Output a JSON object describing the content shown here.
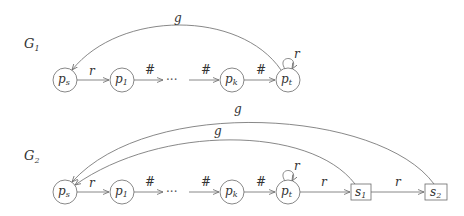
{
  "graphs": [
    {
      "name": "G",
      "index": "1",
      "nodes": [
        {
          "id": "ps",
          "base": "p",
          "sub": "s",
          "shape": "circle"
        },
        {
          "id": "p1",
          "base": "p",
          "sub": "1",
          "shape": "circle"
        },
        {
          "id": "dots",
          "base": "···",
          "sub": "",
          "shape": "none"
        },
        {
          "id": "pk",
          "base": "p",
          "sub": "k",
          "shape": "circle"
        },
        {
          "id": "pt",
          "base": "p",
          "sub": "t",
          "shape": "circle"
        }
      ],
      "edges": [
        {
          "from": "ps",
          "to": "p1",
          "label": "r"
        },
        {
          "from": "p1",
          "to": "dots",
          "label": "#"
        },
        {
          "from": "dots",
          "to": "pk",
          "label": "#"
        },
        {
          "from": "pk",
          "to": "pt",
          "label": "#"
        },
        {
          "from": "pt",
          "to": "pt",
          "label": "r",
          "type": "self-loop"
        },
        {
          "from": "pt",
          "to": "ps",
          "label": "g",
          "type": "arc"
        }
      ]
    },
    {
      "name": "G",
      "index": "2",
      "nodes": [
        {
          "id": "ps",
          "base": "p",
          "sub": "s",
          "shape": "circle"
        },
        {
          "id": "p1",
          "base": "p",
          "sub": "1",
          "shape": "circle"
        },
        {
          "id": "dots",
          "base": "···",
          "sub": "",
          "shape": "none"
        },
        {
          "id": "pk",
          "base": "p",
          "sub": "k",
          "shape": "circle"
        },
        {
          "id": "pt",
          "base": "p",
          "sub": "t",
          "shape": "circle"
        },
        {
          "id": "s1",
          "base": "s",
          "sub": "1",
          "shape": "box"
        },
        {
          "id": "s2",
          "base": "s",
          "sub": "2",
          "shape": "box"
        }
      ],
      "edges": [
        {
          "from": "ps",
          "to": "p1",
          "label": "r"
        },
        {
          "from": "p1",
          "to": "dots",
          "label": "#"
        },
        {
          "from": "dots",
          "to": "pk",
          "label": "#"
        },
        {
          "from": "pk",
          "to": "pt",
          "label": "#"
        },
        {
          "from": "pt",
          "to": "pt",
          "label": "r",
          "type": "self-loop"
        },
        {
          "from": "pt",
          "to": "s1",
          "label": "r"
        },
        {
          "from": "s1",
          "to": "s2",
          "label": "r"
        },
        {
          "from": "s1",
          "to": "ps",
          "label": "g",
          "type": "arc"
        },
        {
          "from": "s2",
          "to": "ps",
          "label": "g",
          "type": "arc"
        }
      ]
    }
  ]
}
